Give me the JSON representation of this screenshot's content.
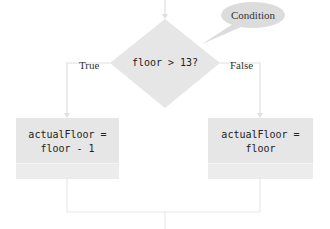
{
  "diagram": {
    "type": "flowchart",
    "callout": {
      "label": "Condition"
    },
    "decision": {
      "condition": "floor > 13?"
    },
    "branches": {
      "true_label": "True",
      "false_label": "False"
    },
    "true_action": {
      "line1": "actualFloor =",
      "line2": "floor - 1"
    },
    "false_action": {
      "line1": "actualFloor =",
      "line2": "floor"
    },
    "colors": {
      "shape_fill": "#e6e6e6",
      "callout_fill": "#dcdcdc",
      "connector": "#e0e0e0",
      "text": "#222222"
    }
  }
}
